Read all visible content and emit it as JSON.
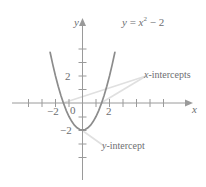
{
  "chart_data": {
    "type": "line",
    "title": "",
    "subtitle": "",
    "xlabel": "x",
    "ylabel": "y",
    "xlim": [
      -3.4,
      3.9
    ],
    "ylim": [
      -3.3,
      4.2
    ],
    "grid": false,
    "legend_position": "none",
    "equation": "y = x² − 2",
    "function": "y = x^2 - 2",
    "x_ticks": [
      -3,
      -2,
      -1,
      1,
      2,
      3
    ],
    "x_tick_labels": [
      "",
      "−2",
      "",
      "",
      "2",
      ""
    ],
    "y_ticks": [
      -3,
      -2,
      -1,
      1,
      2,
      3
    ],
    "y_tick_labels": [
      "",
      "−2",
      "",
      "",
      "2",
      ""
    ],
    "origin_label": "0",
    "series": [
      {
        "name": "y = x² − 2",
        "color": "#8c8c8c",
        "x": [
          -2.4,
          -2.2,
          -2.0,
          -1.8,
          -1.6,
          -1.4142,
          -1.2,
          -1.0,
          -0.8,
          -0.6,
          -0.4,
          -0.2,
          0,
          0.2,
          0.4,
          0.6,
          0.8,
          1.0,
          1.2,
          1.4142,
          1.6,
          1.8,
          2.0,
          2.2,
          2.4
        ],
        "y": [
          3.76,
          2.84,
          2.0,
          1.24,
          0.56,
          0,
          -0.56,
          -1.0,
          -1.36,
          -1.64,
          -1.84,
          -1.96,
          -2.0,
          -1.96,
          -1.84,
          -1.64,
          -1.36,
          -1.0,
          -0.56,
          0,
          0.56,
          1.24,
          2.0,
          2.84,
          3.76
        ]
      }
    ],
    "annotations": [
      {
        "name": "x-intercepts",
        "text": "x-intercepts",
        "italic_prefix": "x",
        "rest": "-intercepts",
        "points": [
          [
            -1.4142,
            0
          ],
          [
            1.4142,
            0
          ]
        ]
      },
      {
        "name": "y-intercept",
        "text": "y-intercept",
        "italic_prefix": "y",
        "rest": "-intercept",
        "points": [
          [
            0,
            -2
          ]
        ]
      }
    ],
    "colors": {
      "curve": "#8c8c8c",
      "axis": "#9a9a9a",
      "text": "#6d6e71",
      "leader": "#d8d8d8",
      "background": "#ffffff"
    }
  },
  "labels": {
    "equation_y": "y",
    "equation_eq": " = ",
    "equation_x": "x",
    "equation_exp": "2",
    "equation_minus": " − 2",
    "x_axis_name": "x",
    "y_axis_name": "y",
    "origin": "0",
    "x_tick_neg2": "−2",
    "x_tick_pos2": "2",
    "y_tick_pos2": "2",
    "y_tick_neg2": "−2",
    "x_intercepts_ital": "x",
    "x_intercepts_rest": "-intercepts",
    "y_intercept_ital": "y",
    "y_intercept_rest": "-intercept"
  }
}
